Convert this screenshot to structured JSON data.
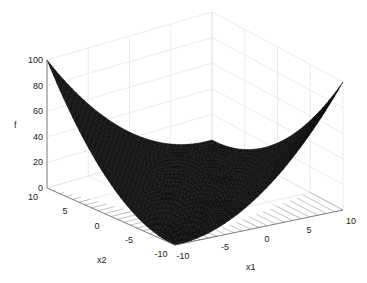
{
  "chart_data": {
    "type": "surface3d",
    "title": "",
    "function_estimate": "f = 0.25*(x1 - x2)^2",
    "xlabel": "x1",
    "ylabel": "x2",
    "zlabel": "f",
    "xlim": [
      -10,
      10
    ],
    "ylim": [
      -10,
      10
    ],
    "zlim": [
      0,
      100
    ],
    "x_ticks": [
      "-10",
      "-5",
      "0",
      "5",
      "10"
    ],
    "y_ticks": [
      "-10",
      "-5",
      "0",
      "5",
      "10"
    ],
    "z_ticks": [
      "0",
      "20",
      "40",
      "60",
      "80",
      "100"
    ],
    "grid": true,
    "colormap": "black mesh (dense)",
    "corner_values": [
      {
        "x1": -10,
        "x2": 10,
        "f": 100
      },
      {
        "x1": 10,
        "x2": -10,
        "f": 100
      },
      {
        "x1": -10,
        "x2": -10,
        "f": 0
      },
      {
        "x1": 10,
        "x2": 10,
        "f": 0
      }
    ]
  },
  "labels": {
    "x1": "x1",
    "x2": "x2",
    "f": "f"
  }
}
